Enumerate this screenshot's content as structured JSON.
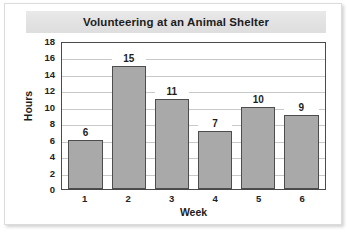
{
  "chart_data": {
    "type": "bar",
    "title": "Volunteering at an Animal Shelter",
    "xlabel": "Week",
    "ylabel": "Hours",
    "categories": [
      "1",
      "2",
      "3",
      "4",
      "5",
      "6"
    ],
    "values": [
      6,
      15,
      11,
      7,
      10,
      9
    ],
    "ylim": [
      0,
      18
    ],
    "ytick_step": 2,
    "yticks": [
      "18",
      "16",
      "14",
      "12",
      "10",
      "8",
      "6",
      "4",
      "2",
      "0"
    ],
    "grid": true,
    "legend": false,
    "data_labels": true,
    "colors": {
      "bar_fill": "#a9a9a9",
      "bar_border": "#4d4d4d",
      "plot_border": "#4a4a4a",
      "gridline": "#c9c9c9",
      "title_band": "#e4e4e4",
      "text": "#1d1d1d",
      "card_background": "#ffffff"
    }
  }
}
